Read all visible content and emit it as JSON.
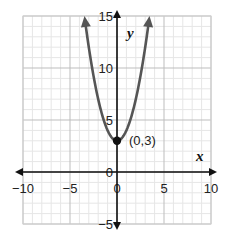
{
  "chart_data": {
    "type": "line",
    "title": "",
    "function": "y = x^2 + 3",
    "xlabel": "x",
    "ylabel": "y",
    "xlim": [
      -10,
      10
    ],
    "ylim": [
      -5,
      15
    ],
    "grid": true,
    "minor_grid_step": 1,
    "major_grid_step": 5,
    "x_ticks": [
      -10,
      -5,
      0,
      5,
      10
    ],
    "x_tick_labels": [
      "−10",
      "−5",
      "0",
      "5",
      "10"
    ],
    "y_ticks": [
      -5,
      0,
      5,
      10,
      15
    ],
    "y_tick_labels": [
      "−5",
      "0",
      "5",
      "10",
      "15"
    ],
    "series": [
      {
        "name": "parabola",
        "color": "#555555",
        "x": [
          -3.46,
          -3,
          -2,
          -1,
          0,
          1,
          2,
          3,
          3.46
        ],
        "y": [
          15,
          12,
          7,
          4,
          3,
          4,
          7,
          12,
          15
        ]
      }
    ],
    "annotations": [
      {
        "x": 0,
        "y": 3,
        "label": "(0,3)",
        "marker": "filled-circle"
      }
    ],
    "legend": null
  },
  "colors": {
    "curve": "#555555",
    "axis": "#111111",
    "major_grid": "#bdbdbd",
    "minor_grid": "#e6e6e6"
  }
}
